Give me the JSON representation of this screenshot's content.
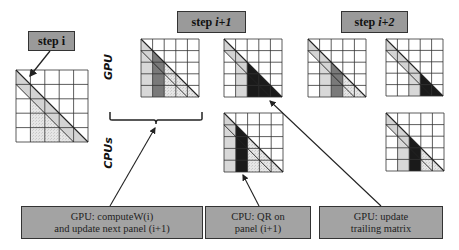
{
  "steps": {
    "step_i": {
      "prefix": "step",
      "index": "i"
    },
    "step_i1": {
      "prefix": "step",
      "index": "i+1"
    },
    "step_i2": {
      "prefix": "step",
      "index": "i+2"
    }
  },
  "rows": {
    "gpu_label": "GPU",
    "cpu_label": "CPUs"
  },
  "notes": {
    "gpu_compute": {
      "line1": "GPU: computeW(i)",
      "line2": "and update next panel (i+1)"
    },
    "cpu_qr": {
      "line1": "CPU: QR on",
      "line2": "panel (i+1)"
    },
    "gpu_update": {
      "line1": "GPU: update",
      "line2": "trailing matrix"
    }
  },
  "colors": {
    "label_fill": "#9a9a9a",
    "light_band": "#d4d4d4",
    "stipple": "#e2e2e2",
    "medium_panel": "#7a7a7a",
    "dark": "#1a1a1a",
    "grid": "#333333"
  },
  "matrices": [
    {
      "name": "step-i-matrix",
      "x": 16,
      "y": 70,
      "size": 72,
      "grid": 5,
      "variant": "base"
    },
    {
      "name": "gpu-step-i1-panel-matrix",
      "x": 141,
      "y": 39,
      "size": 58,
      "grid": 5,
      "variant": "gpu-panel",
      "col": 1
    },
    {
      "name": "gpu-step-i1-trailing-matrix",
      "x": 224,
      "y": 39,
      "size": 58,
      "grid": 5,
      "variant": "gpu-trailing",
      "col": 2
    },
    {
      "name": "cpu-step-i1-matrix",
      "x": 224,
      "y": 113,
      "size": 59,
      "grid": 5,
      "variant": "cpu-panel",
      "col": 1
    },
    {
      "name": "gpu-step-i2-panel-matrix",
      "x": 308,
      "y": 39,
      "size": 58,
      "grid": 5,
      "variant": "gpu-panel",
      "col": 2
    },
    {
      "name": "gpu-step-i2-trailing-matrix",
      "x": 386,
      "y": 39,
      "size": 57,
      "grid": 5,
      "variant": "gpu-trailing",
      "col": 3
    },
    {
      "name": "cpu-step-i2-matrix",
      "x": 386,
      "y": 113,
      "size": 58,
      "grid": 5,
      "variant": "cpu-panel",
      "col": 2
    }
  ]
}
